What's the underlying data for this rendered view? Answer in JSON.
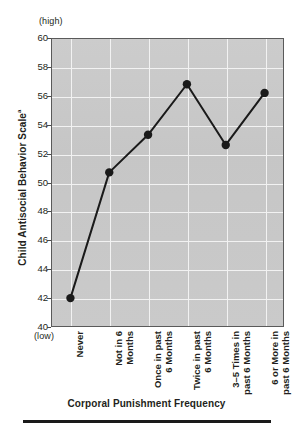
{
  "figure": {
    "y_axis_title": "Child Antisocial Behavior Scale",
    "y_axis_title_superscript": "a",
    "x_axis_title": "Corporal Punishment Frequency",
    "high_note": "(high)",
    "low_note": "(low)"
  },
  "chart_data": {
    "type": "line",
    "title": "",
    "xlabel": "Corporal Punishment Frequency",
    "ylabel": "Child Antisocial Behavior Scale",
    "categories": [
      "Never",
      "Not in 6\nMonths",
      "Once in past\n6 Months",
      "Twice in past\n6 Months",
      "3–5 Times in\npast 6 Months",
      "6 or More in\npast 6 Months"
    ],
    "values": [
      42.0,
      50.7,
      53.3,
      56.8,
      52.6,
      56.2
    ],
    "ylim": [
      40,
      60
    ],
    "yticks": [
      60,
      58,
      56,
      54,
      52,
      50,
      48,
      46,
      44,
      42,
      40
    ],
    "ytick_labels": [
      "60",
      "58",
      "56",
      "54",
      "52",
      "50",
      "48",
      "46",
      "44",
      "42",
      "40"
    ],
    "grid": true,
    "legend": "none",
    "marker": "filled-circle",
    "series_color": "#1a1a1a",
    "plot_background": "#c9c9c9",
    "grid_color": "#f2f2f2",
    "annotations": [
      {
        "text": "(high)",
        "position": "above-y-axis-top"
      },
      {
        "text": "(low)",
        "position": "below-y-axis-bottom"
      }
    ]
  }
}
